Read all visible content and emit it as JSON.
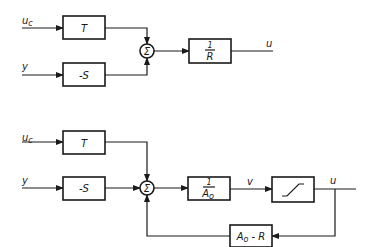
{
  "diagram_top": {
    "inputs": {
      "uc": "u",
      "uc_sub": "c",
      "y": "y"
    },
    "blocks": {
      "T": "T",
      "S": "-S",
      "R_num": "1",
      "R_den": "R"
    },
    "sum": "Σ",
    "output": "u"
  },
  "diagram_bottom": {
    "inputs": {
      "uc": "u",
      "uc_sub": "c",
      "y": "y"
    },
    "blocks": {
      "T": "T",
      "S": "-S",
      "A_num": "1",
      "A_den": "A",
      "A_den_sub": "o",
      "saturation": "saturation",
      "feedback": "A",
      "feedback_sub": "o",
      "feedback_rest": " - R"
    },
    "sum": "Σ",
    "signal_v": "v",
    "output": "u"
  }
}
